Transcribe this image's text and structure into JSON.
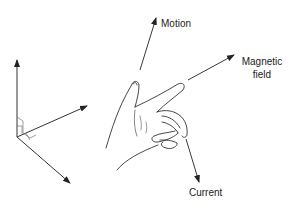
{
  "diagram": {
    "labels": {
      "motion": "Motion",
      "magnetic_field_line1": "Magnetic",
      "magnetic_field_line2": "field",
      "current": "Current"
    },
    "colors": {
      "line": "#333333",
      "background": "#ffffff"
    },
    "axes": {
      "count": 3,
      "mutually_perpendicular": true
    }
  }
}
